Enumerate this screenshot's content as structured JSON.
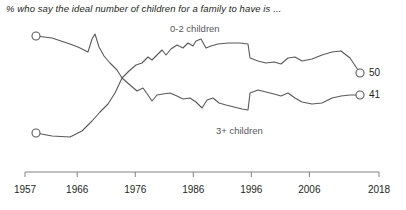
{
  "chart_data": {
    "type": "line",
    "title": "% who say the ideal number of children for a family to have is ...",
    "xlabel": "",
    "ylabel": "",
    "grid": false,
    "legend_position": "inline-labels",
    "xlim": [
      1957,
      2018
    ],
    "ylim": [
      0,
      100
    ],
    "x_ticks": [
      "1957",
      "1966",
      "1976",
      "1986",
      "1996",
      "2006",
      "2018"
    ],
    "x_tick_values": [
      1957,
      1966,
      1976,
      1986,
      1996,
      2006,
      2018
    ],
    "series": [
      {
        "name": "0-2 children",
        "label": "0-2 children",
        "color": "#58595b",
        "end_value": 50,
        "end_label": "50",
        "start_value": 19,
        "x": [
          1957,
          1962,
          1965,
          1966,
          1967,
          1971,
          1972,
          1973,
          1974,
          1975,
          1976,
          1977,
          1978,
          1980,
          1982,
          1983,
          1985,
          1986,
          1988,
          1989,
          1990,
          1991,
          1993,
          1994,
          1996,
          1997,
          1998,
          2001,
          2003,
          2004,
          2007,
          2011,
          2013,
          2018
        ],
        "y": [
          19,
          20,
          25,
          18,
          30,
          22,
          34,
          40,
          46,
          50,
          54,
          52,
          57,
          55,
          58,
          56,
          60,
          58,
          62,
          60,
          61,
          60,
          60,
          59,
          59,
          52,
          51,
          51,
          52,
          53,
          54,
          55,
          55,
          50
        ],
        "pixel_points": [
          [
            36,
            36
          ],
          [
            52,
            38
          ],
          [
            70,
            44
          ],
          [
            78,
            47
          ],
          [
            82,
            49
          ],
          [
            88,
            52
          ],
          [
            92,
            39
          ],
          [
            95,
            34
          ],
          [
            99,
            47
          ],
          [
            104,
            56
          ],
          [
            110,
            63
          ],
          [
            117,
            70
          ],
          [
            122,
            78
          ],
          [
            129,
            71
          ],
          [
            136,
            65
          ],
          [
            142,
            63
          ],
          [
            148,
            57
          ],
          [
            152,
            60
          ],
          [
            157,
            55
          ],
          [
            162,
            50
          ],
          [
            166,
            55
          ],
          [
            171,
            49
          ],
          [
            177,
            45
          ],
          [
            183,
            48
          ],
          [
            188,
            43
          ],
          [
            193,
            46
          ],
          [
            196,
            41
          ],
          [
            201,
            39
          ],
          [
            206,
            48
          ],
          [
            211,
            46
          ],
          [
            218,
            44
          ],
          [
            228,
            43
          ],
          [
            240,
            43
          ],
          [
            248,
            44
          ],
          [
            250,
            58
          ],
          [
            258,
            61
          ],
          [
            266,
            63
          ],
          [
            274,
            62
          ],
          [
            281,
            64
          ],
          [
            288,
            58
          ],
          [
            295,
            57
          ],
          [
            302,
            61
          ],
          [
            312,
            59
          ],
          [
            322,
            55
          ],
          [
            332,
            52
          ],
          [
            341,
            51
          ],
          [
            350,
            58
          ],
          [
            360,
            73
          ]
        ]
      },
      {
        "name": "3+ children",
        "label": "3+ children",
        "color": "#58595b",
        "end_value": 41,
        "end_label": "41",
        "start_value": 74,
        "x": [
          1957,
          1962,
          1965,
          1966,
          1967,
          1971,
          1972,
          1973,
          1974,
          1975,
          1976,
          1977,
          1978,
          1980,
          1982,
          1983,
          1985,
          1986,
          1988,
          1989,
          1990,
          1991,
          1993,
          1994,
          1996,
          1997,
          1998,
          2001,
          2003,
          2004,
          2007,
          2011,
          2013,
          2018
        ],
        "y": [
          74,
          73,
          72,
          73,
          72,
          70,
          66,
          58,
          50,
          46,
          42,
          40,
          38,
          40,
          36,
          37,
          34,
          36,
          33,
          35,
          32,
          34,
          33,
          30,
          30,
          39,
          38,
          39,
          38,
          37,
          36,
          38,
          39,
          41
        ],
        "pixel_points": [
          [
            36,
            133
          ],
          [
            52,
            136
          ],
          [
            70,
            137
          ],
          [
            82,
            131
          ],
          [
            92,
            121
          ],
          [
            100,
            112
          ],
          [
            108,
            104
          ],
          [
            115,
            93
          ],
          [
            122,
            78
          ],
          [
            130,
            85
          ],
          [
            137,
            91
          ],
          [
            143,
            88
          ],
          [
            148,
            95
          ],
          [
            152,
            101
          ],
          [
            157,
            95
          ],
          [
            163,
            94
          ],
          [
            170,
            93
          ],
          [
            177,
            96
          ],
          [
            183,
            99
          ],
          [
            190,
            98
          ],
          [
            196,
            102
          ],
          [
            202,
            108
          ],
          [
            207,
            100
          ],
          [
            213,
            98
          ],
          [
            219,
            103
          ],
          [
            226,
            105
          ],
          [
            234,
            107
          ],
          [
            242,
            109
          ],
          [
            248,
            110
          ],
          [
            250,
            93
          ],
          [
            258,
            90
          ],
          [
            266,
            92
          ],
          [
            274,
            94
          ],
          [
            281,
            96
          ],
          [
            288,
            93
          ],
          [
            295,
            98
          ],
          [
            302,
            102
          ],
          [
            312,
            104
          ],
          [
            322,
            103
          ],
          [
            332,
            98
          ],
          [
            341,
            96
          ],
          [
            350,
            95
          ],
          [
            360,
            95
          ]
        ]
      }
    ]
  },
  "axis": {
    "line_color": "#808285",
    "tick_color": "#808285"
  }
}
